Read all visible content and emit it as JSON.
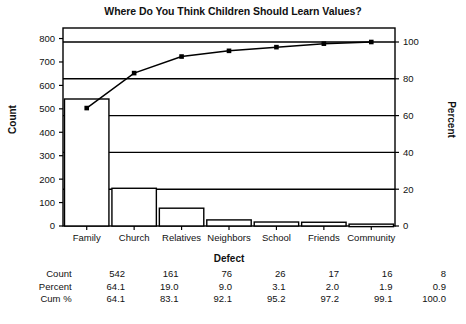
{
  "chart_data": {
    "type": "bar",
    "title": "Where Do You Think Children Should Learn Values?",
    "xlabel": "Defect",
    "ylabel": "Count",
    "y2label": "Percent",
    "categories": [
      "Family",
      "Church",
      "Relatives",
      "Neighbors",
      "School",
      "Friends",
      "Community"
    ],
    "values": [
      542,
      161,
      76,
      26,
      17,
      16,
      8
    ],
    "series": [
      {
        "name": "Count",
        "values": [
          542,
          161,
          76,
          26,
          17,
          16,
          8
        ]
      },
      {
        "name": "Cum %",
        "values": [
          64.1,
          83.1,
          92.1,
          95.2,
          97.2,
          99.1,
          100.0
        ]
      }
    ],
    "percent": [
      64.1,
      19.0,
      9.0,
      3.1,
      2.0,
      1.9,
      0.9
    ],
    "ylim": [
      0,
      845
    ],
    "y2lim": [
      0,
      100
    ],
    "yticks": [
      0,
      100,
      200,
      300,
      400,
      500,
      600,
      700,
      800
    ],
    "y2ticks": [
      0,
      20,
      40,
      60,
      80,
      100
    ],
    "grid": true,
    "legend": "none"
  },
  "table": {
    "rows": [
      {
        "label": "Count",
        "cells": [
          "542",
          "161",
          "76",
          "26",
          "17",
          "16",
          "8"
        ]
      },
      {
        "label": "Percent",
        "cells": [
          "64.1",
          "19.0",
          "9.0",
          "3.1",
          "2.0",
          "1.9",
          "0.9"
        ]
      },
      {
        "label": "Cum %",
        "cells": [
          "64.1",
          "83.1",
          "92.1",
          "95.2",
          "97.2",
          "99.1",
          "100.0"
        ]
      }
    ]
  },
  "style": {
    "line_color": "#000000",
    "bar_fill": "#ffffff",
    "bar_stroke": "#000000",
    "grid_color": "#000000",
    "text_color": "#111111"
  }
}
